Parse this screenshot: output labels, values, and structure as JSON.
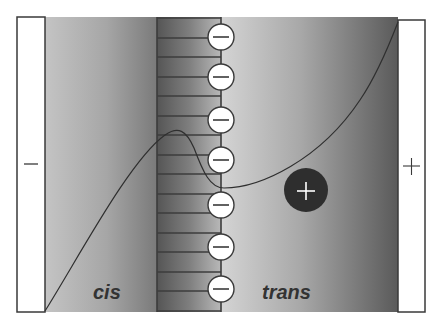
{
  "diagram": {
    "type": "membrane-potential-profile",
    "electrodes": {
      "left": {
        "sign": "−",
        "label": "negative-electrode"
      },
      "right": {
        "sign": "+",
        "label": "positive-electrode"
      }
    },
    "regions": {
      "left_label": "cis",
      "right_label": "trans"
    },
    "channel": {
      "fixed_charges": [
        "−",
        "−",
        "−",
        "−",
        "−",
        "−",
        "−",
        "−"
      ],
      "fixed_charge_count": 8
    },
    "ion": {
      "sign": "+"
    },
    "colors": {
      "background": "#ffffff",
      "electrode_fill": "#ffffff",
      "outline": "#3a3a3a",
      "gradient_light": "#d2d2d2",
      "gradient_mid": "#9a9a9a",
      "gradient_dark": "#555555",
      "ion_fill": "#2e2e2e",
      "charge_fill": "#ffffff",
      "label_color": "#333333"
    }
  }
}
